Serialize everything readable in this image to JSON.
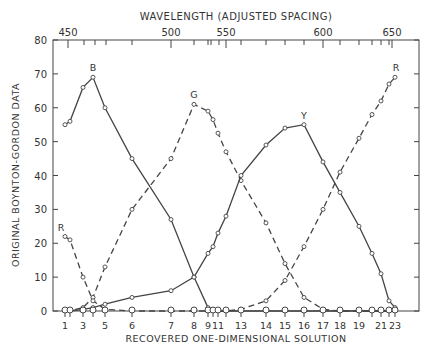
{
  "chart_data": {
    "type": "line",
    "title": "",
    "top_axis_label": "WAVELENGTH (ADJUSTED SPACING)",
    "top_tick_labels": [
      "450",
      "500",
      "550",
      "600",
      "650"
    ],
    "xlabel": "RECOVERED ONE-DIMENSIONAL SOLUTION",
    "ylabel": "ORIGINAL BOYNTON-GORDON DATA",
    "ylim": [
      0,
      80
    ],
    "yticks": [
      0,
      10,
      20,
      30,
      40,
      50,
      60,
      70,
      80
    ],
    "x_tick_labels": [
      "1",
      "3",
      "5",
      "6",
      "7",
      "8",
      "9",
      "11",
      "13",
      "14",
      "15",
      "16",
      "17",
      "18",
      "19",
      "21",
      "23"
    ],
    "grid": false,
    "legend": "inline curve labels (B, G, Y, R)",
    "x_positions_px": [
      65,
      70,
      83,
      93,
      105,
      132,
      171,
      194,
      208,
      213,
      218,
      226,
      241,
      266,
      285,
      304,
      323,
      340,
      359,
      372,
      381,
      389,
      395
    ],
    "stimuli": [
      "1",
      "2",
      "3",
      "4",
      "5",
      "6",
      "7",
      "8",
      "9",
      "10",
      "11",
      "12",
      "13",
      "14",
      "15",
      "16",
      "17",
      "18",
      "19",
      "20",
      "21",
      "22",
      "23"
    ],
    "series": [
      {
        "name": "B",
        "style": "solid",
        "values": [
          55,
          56,
          66,
          69,
          60,
          45,
          27,
          10,
          1,
          0.5,
          0,
          0,
          0,
          0,
          0,
          0,
          0,
          0,
          0,
          0,
          0,
          0,
          0
        ]
      },
      {
        "name": "G",
        "style": "dashed",
        "values": [
          0,
          0,
          1,
          4,
          13,
          30,
          45,
          61,
          59,
          56.5,
          52.5,
          47,
          38.5,
          26,
          14,
          4,
          0.5,
          0,
          0,
          0,
          0,
          0,
          0
        ]
      },
      {
        "name": "Y",
        "style": "solid",
        "values": [
          0,
          0,
          0.5,
          1,
          2,
          4,
          6,
          10,
          17,
          19,
          23,
          28,
          40,
          49,
          54,
          55,
          44,
          35,
          25,
          17,
          11,
          3,
          1
        ]
      },
      {
        "name": "R",
        "style": "dashed",
        "values": [
          22,
          21,
          10,
          3,
          0.5,
          0,
          0,
          0,
          0,
          0,
          0,
          0,
          0.5,
          3,
          9,
          19,
          30,
          41,
          51,
          58,
          62,
          67,
          69
        ]
      }
    ]
  }
}
